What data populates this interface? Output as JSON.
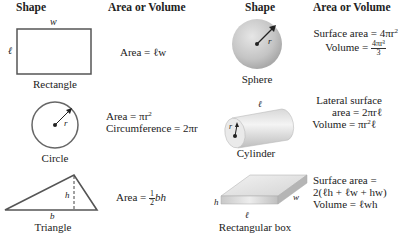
{
  "headers": {
    "left_shape": "Shape",
    "left_formula": "Area or Volume",
    "right_shape": "Shape",
    "right_formula": "Area or Volume"
  },
  "shapes": {
    "rectangle": {
      "name": "Rectangle",
      "dim_w": "w",
      "dim_l": "ℓ",
      "formula": "Area = ℓw"
    },
    "circle": {
      "name": "Circle",
      "dim_r": "r",
      "formula_area_prefix": "Area = πr",
      "formula_area_exp": "2",
      "formula_circ": "Circumference = 2πr"
    },
    "triangle": {
      "name": "Triangle",
      "dim_h": "h",
      "dim_b": "b",
      "formula_prefix": "Area = ",
      "frac_num": "1",
      "frac_den": "2",
      "formula_suffix": "bh"
    },
    "sphere": {
      "name": "Sphere",
      "dim_r": "r",
      "surface_prefix": "Surface area = 4πr",
      "surface_exp": "2",
      "volume_prefix": "Volume = ",
      "volume_num": "4πr³",
      "volume_den": "3"
    },
    "cylinder": {
      "name": "Cylinder",
      "dim_l": "ℓ",
      "dim_r": "r",
      "lateral_line1": "Lateral surface",
      "lateral_line2": "area = 2πrℓ",
      "volume_prefix": "Volume = πr",
      "volume_exp": "2",
      "volume_suffix": "ℓ"
    },
    "box": {
      "name": "Rectangular box",
      "dim_h": "h",
      "dim_w": "w",
      "dim_l": "ℓ",
      "surface_line1": "Surface area =",
      "surface_line2": "2(ℓh + ℓw + hw)",
      "volume": "Volume = ℓwh"
    }
  }
}
